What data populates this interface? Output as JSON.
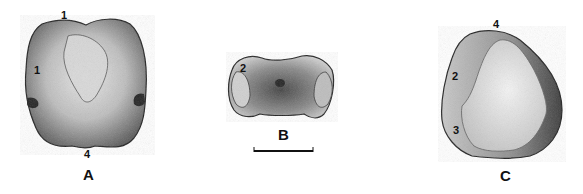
{
  "figure": {
    "views": [
      {
        "id": "A",
        "label": "A",
        "description": "occlusal view",
        "landmarks": [
          "1",
          "1",
          "4"
        ]
      },
      {
        "id": "B",
        "label": "B",
        "description": "lateral view",
        "landmarks": [
          "2"
        ]
      },
      {
        "id": "C",
        "label": "C",
        "description": "basal view",
        "landmarks": [
          "4",
          "2",
          "3"
        ]
      }
    ],
    "scale_bar": {
      "label": ""
    },
    "colors": {
      "ink": "#111111",
      "paper": "#ffffff",
      "shade_dark": "#3a3a3a",
      "shade_light": "#e6e6e6"
    }
  }
}
